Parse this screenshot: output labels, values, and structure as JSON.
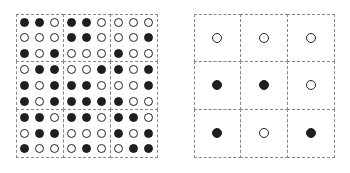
{
  "diagram": {
    "legend": {
      "filled": "filled circle",
      "empty": "empty circle"
    },
    "left_grid": {
      "description": "9x9 dot matrix divided into 3x3 blocks",
      "rows": [
        [
          1,
          1,
          0,
          1,
          1,
          0,
          0,
          0,
          0
        ],
        [
          0,
          0,
          0,
          1,
          1,
          0,
          0,
          0,
          1
        ],
        [
          1,
          0,
          1,
          0,
          0,
          0,
          1,
          0,
          0
        ],
        [
          0,
          1,
          1,
          0,
          0,
          1,
          1,
          0,
          1
        ],
        [
          1,
          0,
          1,
          1,
          1,
          0,
          0,
          0,
          1
        ],
        [
          1,
          0,
          1,
          1,
          1,
          1,
          1,
          0,
          0
        ],
        [
          1,
          1,
          0,
          1,
          1,
          0,
          1,
          1,
          0
        ],
        [
          0,
          1,
          1,
          0,
          0,
          0,
          1,
          0,
          1
        ],
        [
          1,
          0,
          0,
          0,
          1,
          0,
          0,
          1,
          1
        ]
      ]
    },
    "right_grid": {
      "description": "3x3 grid, one dot per block",
      "rows": [
        [
          0,
          0,
          0
        ],
        [
          1,
          1,
          0
        ],
        [
          1,
          0,
          1
        ]
      ]
    },
    "colors": {
      "dot": "#1f1f1f",
      "dash": "#888888",
      "background": "#ffffff"
    }
  }
}
